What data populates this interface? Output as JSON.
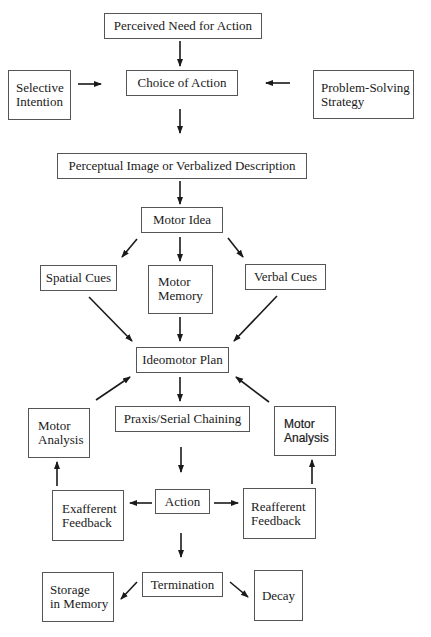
{
  "diagram": {
    "nodes": {
      "perceived_need": {
        "label": "Perceived Need for Action"
      },
      "choice_of_action": {
        "label": "Choice of Action"
      },
      "selective_intention": {
        "label": "Selective\nIntention"
      },
      "problem_solving": {
        "label": "Problem-Solving\nStrategy"
      },
      "perceptual_image": {
        "label": "Perceptual Image or Verbalized Description"
      },
      "motor_idea": {
        "label": "Motor Idea"
      },
      "spatial_cues": {
        "label": "Spatial Cues"
      },
      "motor_memory": {
        "label": "Motor\nMemory"
      },
      "verbal_cues": {
        "label": "Verbal Cues"
      },
      "ideomotor_plan": {
        "label": "Ideomotor Plan"
      },
      "motor_analysis_left": {
        "label": "Motor\nAnalysis"
      },
      "praxis": {
        "label": "Praxis/Serial Chaining"
      },
      "motor_analysis_right": {
        "label": "Motor\nAnalysis"
      },
      "exafferent": {
        "label": "Exafferent\nFeedback"
      },
      "action": {
        "label": "Action"
      },
      "reafferent": {
        "label": "Reafferent\nFeedback"
      },
      "storage": {
        "label": "Storage\nin Memory"
      },
      "termination": {
        "label": "Termination"
      },
      "decay": {
        "label": "Decay"
      }
    },
    "edges": [
      [
        "perceived_need",
        "choice_of_action"
      ],
      [
        "selective_intention",
        "choice_of_action"
      ],
      [
        "problem_solving",
        "choice_of_action"
      ],
      [
        "choice_of_action",
        "perceptual_image"
      ],
      [
        "perceptual_image",
        "motor_idea"
      ],
      [
        "motor_idea",
        "spatial_cues"
      ],
      [
        "motor_idea",
        "motor_memory"
      ],
      [
        "motor_idea",
        "verbal_cues"
      ],
      [
        "spatial_cues",
        "ideomotor_plan"
      ],
      [
        "motor_memory",
        "ideomotor_plan"
      ],
      [
        "verbal_cues",
        "ideomotor_plan"
      ],
      [
        "ideomotor_plan",
        "praxis"
      ],
      [
        "motor_analysis_left",
        "ideomotor_plan"
      ],
      [
        "motor_analysis_right",
        "ideomotor_plan"
      ],
      [
        "praxis",
        "action"
      ],
      [
        "action",
        "exafferent"
      ],
      [
        "action",
        "reafferent"
      ],
      [
        "exafferent",
        "motor_analysis_left"
      ],
      [
        "reafferent",
        "motor_analysis_right"
      ],
      [
        "action",
        "termination"
      ],
      [
        "termination",
        "storage"
      ],
      [
        "termination",
        "decay"
      ]
    ],
    "colors": {
      "line": "#1a1a1a",
      "box_border": "#555555",
      "background": "#ffffff"
    }
  }
}
